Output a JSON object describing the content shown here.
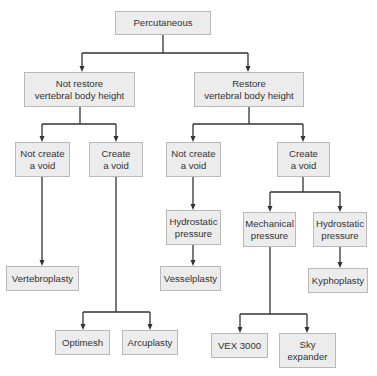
{
  "diagram": {
    "type": "tree-flowchart",
    "colors": {
      "node_fill": "#ececec",
      "node_border": "#b9b9b9",
      "edge": "#333333",
      "text": "#333333"
    },
    "nodes": [
      {
        "id": "percutaneous",
        "label": "Percutaneous",
        "x": 115,
        "y": 11,
        "w": 96,
        "h": 24
      },
      {
        "id": "not-restore",
        "label": "Not restore\nvertebral body height",
        "x": 24,
        "y": 72,
        "w": 111,
        "h": 35
      },
      {
        "id": "restore",
        "label": "Restore\nvertebral body height",
        "x": 194,
        "y": 72,
        "w": 110,
        "h": 35
      },
      {
        "id": "nr-not-create",
        "label": "Not create\na void",
        "x": 15,
        "y": 142,
        "w": 55,
        "h": 35
      },
      {
        "id": "nr-create",
        "label": "Create\na void",
        "x": 89,
        "y": 142,
        "w": 54,
        "h": 35
      },
      {
        "id": "r-not-create",
        "label": "Not create\na void",
        "x": 166,
        "y": 142,
        "w": 55,
        "h": 35
      },
      {
        "id": "r-create",
        "label": "Create\na void",
        "x": 277,
        "y": 142,
        "w": 53,
        "h": 35
      },
      {
        "id": "hydrostatic-mid",
        "label": "Hydrostatic\npressure",
        "x": 166,
        "y": 210,
        "w": 55,
        "h": 35
      },
      {
        "id": "mechanical",
        "label": "Mechanical\npressure",
        "x": 243,
        "y": 212,
        "w": 53,
        "h": 35
      },
      {
        "id": "hydrostatic-right",
        "label": "Hydrostatic\npressure",
        "x": 313,
        "y": 212,
        "w": 54,
        "h": 35
      },
      {
        "id": "vertebroplasty",
        "label": "Vertebroplasty",
        "x": 6,
        "y": 266,
        "w": 73,
        "h": 25
      },
      {
        "id": "vesselplasty",
        "label": "Vesselplasty",
        "x": 160,
        "y": 266,
        "w": 61,
        "h": 25
      },
      {
        "id": "kyphoplasty",
        "label": "Kyphoplasty",
        "x": 308,
        "y": 268,
        "w": 60,
        "h": 25
      },
      {
        "id": "optimesh",
        "label": "Optimesh",
        "x": 55,
        "y": 330,
        "w": 55,
        "h": 25
      },
      {
        "id": "arcuplasty",
        "label": "Arcuplasty",
        "x": 122,
        "y": 330,
        "w": 56,
        "h": 25
      },
      {
        "id": "vex-3000",
        "label": "VEX 3000",
        "x": 211,
        "y": 333,
        "w": 57,
        "h": 25
      },
      {
        "id": "sky-expander",
        "label": "Sky\nexpander",
        "x": 279,
        "y": 333,
        "w": 57,
        "h": 35
      }
    ],
    "edges": [
      {
        "from": "percutaneous",
        "to": "not-restore"
      },
      {
        "from": "percutaneous",
        "to": "restore"
      },
      {
        "from": "not-restore",
        "to": "nr-not-create"
      },
      {
        "from": "not-restore",
        "to": "nr-create"
      },
      {
        "from": "restore",
        "to": "r-not-create"
      },
      {
        "from": "restore",
        "to": "r-create"
      },
      {
        "from": "nr-not-create",
        "to": "vertebroplasty"
      },
      {
        "from": "nr-create",
        "to": "optimesh"
      },
      {
        "from": "nr-create",
        "to": "arcuplasty"
      },
      {
        "from": "r-not-create",
        "to": "hydrostatic-mid"
      },
      {
        "from": "hydrostatic-mid",
        "to": "vesselplasty"
      },
      {
        "from": "r-create",
        "to": "mechanical"
      },
      {
        "from": "r-create",
        "to": "hydrostatic-right"
      },
      {
        "from": "hydrostatic-right",
        "to": "kyphoplasty"
      },
      {
        "from": "mechanical",
        "to": "vex-3000"
      },
      {
        "from": "mechanical",
        "to": "sky-expander"
      }
    ],
    "connectors": [
      {
        "name": "percutaneous-split",
        "path": "M163,35 V53 M82,53 H248 M82,53 V70 M248,53 V70",
        "arrows": [
          [
            82,
            72
          ],
          [
            248,
            72
          ]
        ]
      },
      {
        "name": "not-restore-split",
        "path": "M80,107 V124 M42,124 H116 M42,124 V140 M116,124 V140",
        "arrows": [
          [
            42,
            142
          ],
          [
            116,
            142
          ]
        ]
      },
      {
        "name": "restore-split",
        "path": "M249,107 V124 M193,124 H303 M193,124 V140 M303,124 V140",
        "arrows": [
          [
            193,
            142
          ],
          [
            303,
            142
          ]
        ]
      },
      {
        "name": "nr-not-create-down",
        "path": "M42,177 V264",
        "arrows": [
          [
            42,
            266
          ]
        ]
      },
      {
        "name": "nr-create-split",
        "path": "M116,177 V312 M83,312 H150 M83,312 V328 M150,312 V328",
        "arrows": [
          [
            83,
            330
          ],
          [
            150,
            330
          ]
        ]
      },
      {
        "name": "r-not-create-down",
        "path": "M193,177 V208",
        "arrows": [
          [
            193,
            210
          ]
        ]
      },
      {
        "name": "hydrostatic-mid-down",
        "path": "M193,245 V264",
        "arrows": [
          [
            193,
            266
          ]
        ]
      },
      {
        "name": "r-create-split",
        "path": "M303,177 V192 M270,192 H340 M270,192 V210 M340,192 V210",
        "arrows": [
          [
            270,
            212
          ],
          [
            340,
            212
          ]
        ]
      },
      {
        "name": "hydrostatic-right-down",
        "path": "M340,247 V266",
        "arrows": [
          [
            340,
            268
          ]
        ]
      },
      {
        "name": "mechanical-split",
        "path": "M270,247 V314 M240,314 H307 M240,314 V331 M307,314 V331",
        "arrows": [
          [
            240,
            333
          ],
          [
            307,
            333
          ]
        ]
      }
    ]
  }
}
